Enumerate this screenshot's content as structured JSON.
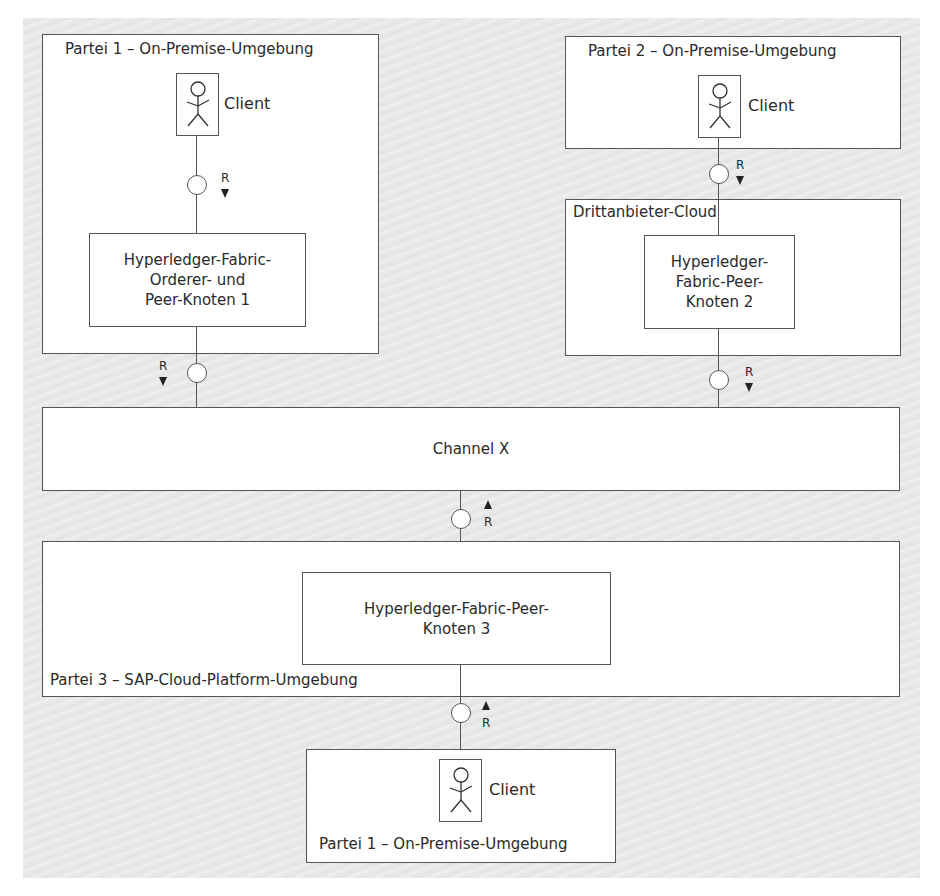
{
  "diagram": {
    "type": "deployment-architecture",
    "nodes": {
      "party1_top": {
        "title": "Partei 1 – On-Premise-Umgebung",
        "client_label": "Client",
        "node_label_lines": [
          "Hyperledger-Fabric-",
          "Orderer- und",
          "Peer-Knoten 1"
        ]
      },
      "party2": {
        "title": "Partei 2 – On-Premise-Umgebung",
        "client_label": "Client"
      },
      "third_party_cloud": {
        "title": "Drittanbieter-Cloud",
        "node_label_lines": [
          "Hyperledger-",
          "Fabric-Peer-",
          "Knoten 2"
        ]
      },
      "channel": {
        "label": "Channel X"
      },
      "party3": {
        "title": "Partei 3 – SAP-Cloud-Platform-Umgebung",
        "node_label_lines": [
          "Hyperledger-Fabric-Peer-",
          "Knoten 3"
        ]
      },
      "party1_bottom": {
        "title": "Partei 1 – On-Premise-Umgebung",
        "client_label": "Client"
      }
    },
    "connectors": [
      {
        "from": "party1_top.client",
        "to": "party1_top.node",
        "label": "R",
        "direction": "down"
      },
      {
        "from": "party1_top.node",
        "to": "channel",
        "label": "R",
        "direction": "down"
      },
      {
        "from": "party2.client",
        "to": "third_party_cloud.node",
        "label": "R",
        "direction": "down"
      },
      {
        "from": "third_party_cloud.node",
        "to": "channel",
        "label": "R",
        "direction": "down"
      },
      {
        "from": "party3.node",
        "to": "channel",
        "label": "R",
        "direction": "up"
      },
      {
        "from": "party1_bottom.client",
        "to": "party3.node",
        "label": "R",
        "direction": "up"
      }
    ],
    "colors": {
      "background": "#e9e9e9",
      "box_fill": "#ffffff",
      "stroke": "#555555",
      "text": "#2a2a2a"
    }
  }
}
